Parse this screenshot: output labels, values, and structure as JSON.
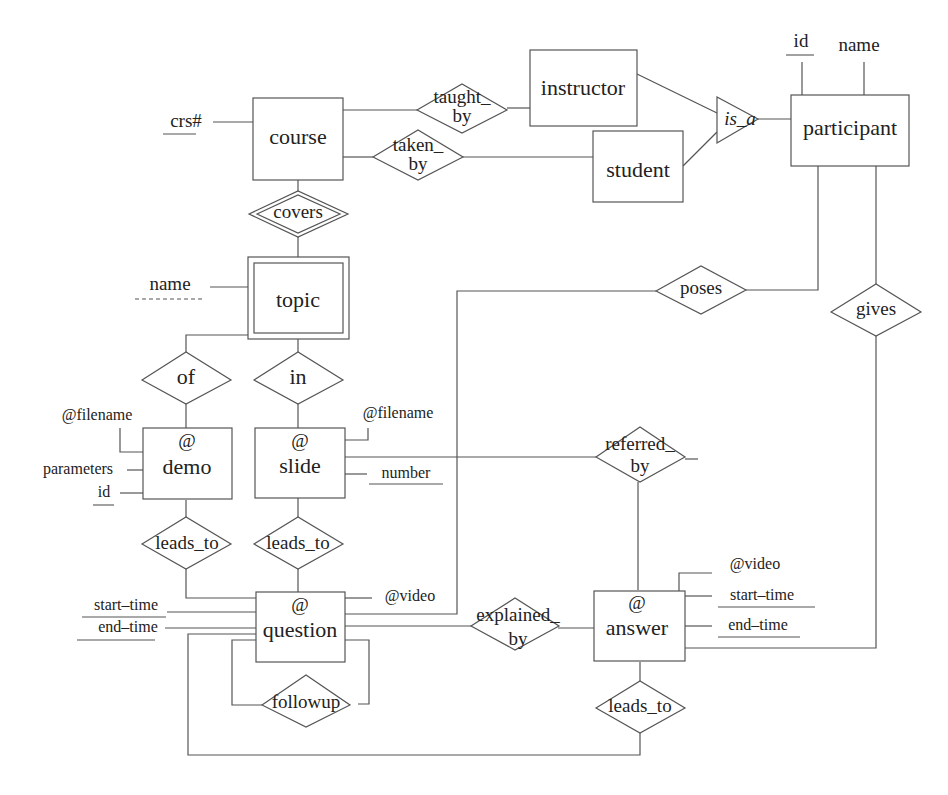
{
  "diagram": {
    "type": "ER diagram",
    "entities": {
      "course": "course",
      "instructor": "instructor",
      "student": "student",
      "participant": "participant",
      "topic": "topic",
      "demo_at": "@",
      "demo": "demo",
      "slide_at": "@",
      "slide": "slide",
      "question_at": "@",
      "question": "question",
      "answer_at": "@",
      "answer": "answer"
    },
    "relationships": {
      "taught_by_1": "taught_",
      "taught_by_2": "by",
      "taken_by_1": "taken_",
      "taken_by_2": "by",
      "covers": "covers",
      "is_a": "is_a",
      "poses": "poses",
      "gives": "gives",
      "of": "of",
      "in": "in",
      "referred_by_1": "referred_",
      "referred_by_2": "by",
      "leads_to_demo": "leads_to",
      "leads_to_slide": "leads_to",
      "explained_by_1": "explained_",
      "explained_by_2": "by",
      "followup": "followup",
      "leads_to_answer": "leads_to"
    },
    "attributes": {
      "crs": "crs#",
      "participant_id": "id",
      "participant_name": "name",
      "topic_name": "name",
      "demo_filename": "@filename",
      "demo_parameters": "parameters",
      "demo_id": "id",
      "slide_filename": "@filename",
      "slide_number": "number",
      "question_video": "@video",
      "question_start": "start–time",
      "question_end": "end–time",
      "answer_video": "@video",
      "answer_start": "start–time",
      "answer_end": "end–time"
    }
  }
}
